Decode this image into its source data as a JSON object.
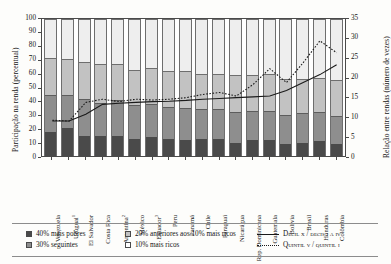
{
  "axes": {
    "left_title": "Participação na renda (percentual)",
    "right_title": "Relação entre rendas (número de vezes)",
    "left_ticks": [
      "100",
      "90",
      "80",
      "70",
      "60",
      "50",
      "40",
      "30",
      "20",
      "10",
      "0"
    ],
    "right_ticks": [
      "35",
      "30",
      "25",
      "20",
      "15",
      "10",
      "5",
      "0"
    ]
  },
  "legend": {
    "items": [
      {
        "label": "40% mais pobres",
        "swatch": "dark-gray-swatch",
        "color": "#4a4a4a"
      },
      {
        "label": "30% seguintes",
        "swatch": "medium-gray-swatch",
        "color": "#8e8e8e"
      },
      {
        "label": "20% anteriores aos 10% mais ricos",
        "swatch": "light-gray-swatch",
        "color": "#c2c2c2"
      },
      {
        "label": "10% mais ricos",
        "swatch": "white-swatch",
        "color": "#eeeeee"
      }
    ],
    "lines": [
      {
        "label": "Decil x / decis i a iv",
        "style": "solid",
        "color": "#1a1a1a"
      },
      {
        "label": "Quintil v / quintil i",
        "style": "dotted",
        "color": "#1a1a1a"
      }
    ]
  },
  "chart_data": {
    "type": "bar",
    "title": "",
    "xlabel": "",
    "ylabel": "Participação na renda (percentual)",
    "y2label": "Relação entre rendas (número de vezes)",
    "ylim": [
      0,
      100
    ],
    "y2lim": [
      0,
      35
    ],
    "grid": false,
    "legend_position": "bottom",
    "categories": [
      "Venezuela",
      "Uruguai",
      "El Salvador",
      "Costa Rica",
      "Argentina",
      "México",
      "Equador",
      "Peru",
      "Panamá",
      "Chile",
      "Paraguai",
      "Nicarágua",
      "Rep. Dominicana",
      "Guatemala",
      "Bolívia",
      "Brasil",
      "Honduras",
      "Colômbia"
    ],
    "category_footnotes": {
      "Uruguai": "1",
      "Argentina": "2",
      "Equador": "3"
    },
    "series": [
      {
        "name": "40% mais pobres",
        "color": "#4a4a4a",
        "values": [
          18,
          21,
          15,
          15,
          15,
          13,
          14,
          13,
          12,
          13,
          13,
          10,
          12,
          12,
          9,
          10,
          11,
          9
        ]
      },
      {
        "name": "30% seguintes",
        "color": "#8e8e8e",
        "values": [
          27,
          24,
          27,
          24,
          26,
          24,
          24,
          23,
          23,
          21,
          21,
          22,
          21,
          21,
          21,
          21,
          21,
          20
        ]
      },
      {
        "name": "20% anteriores aos 10% mais ricos",
        "color": "#c2c2c2",
        "values": [
          27,
          26,
          27,
          28,
          26,
          26,
          26,
          26,
          27,
          26,
          26,
          27,
          26,
          27,
          26,
          25,
          25,
          26
        ]
      },
      {
        "name": "10% mais ricos",
        "color": "#eeeeee",
        "values": [
          28,
          29,
          31,
          33,
          33,
          37,
          36,
          38,
          38,
          40,
          40,
          41,
          41,
          40,
          44,
          44,
          43,
          45
        ]
      }
    ],
    "lines": [
      {
        "name": "Decil x / decis i a iv",
        "style": "solid",
        "axis": "right",
        "values": [
          9.3,
          9.3,
          11.0,
          13.5,
          13.8,
          14.0,
          14.2,
          14.3,
          14.5,
          14.8,
          15.0,
          15.2,
          15.4,
          15.6,
          17.0,
          19.0,
          21.0,
          23.5
        ]
      },
      {
        "name": "Quintil v / quintil i",
        "style": "dotted",
        "axis": "right",
        "values": [
          9.5,
          9.3,
          14.0,
          14.8,
          14.2,
          14.8,
          14.6,
          14.8,
          15.2,
          16.0,
          16.5,
          15.6,
          18.5,
          22.5,
          19.0,
          24.0,
          29.5,
          26.5
        ]
      }
    ]
  }
}
